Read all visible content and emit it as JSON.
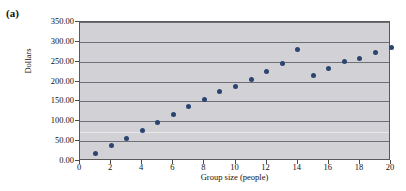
{
  "figure": {
    "panel_label": "(a)"
  },
  "chart_data": {
    "type": "scatter",
    "title": "",
    "xlabel": "Group size (people)",
    "ylabel": "Dollars",
    "xlim": [
      0,
      20
    ],
    "ylim": [
      0,
      350
    ],
    "grid": true,
    "legend": null,
    "marker_color": "#2b4470",
    "plot_background": "#d2d2d6",
    "x_tick_labels": [
      "0",
      "2",
      "4",
      "6",
      "8",
      "10",
      "12",
      "14",
      "16",
      "18",
      "20"
    ],
    "x_ticks": [
      0,
      2,
      4,
      6,
      8,
      10,
      12,
      14,
      16,
      18,
      20
    ],
    "y_tick_labels": [
      "0.00",
      "50.00",
      "100.00",
      "150.00",
      "200.00",
      "250.00",
      "300.00",
      "350.00"
    ],
    "y_ticks": [
      0,
      50,
      100,
      150,
      200,
      250,
      300,
      350
    ],
    "x": [
      1,
      2,
      3,
      4,
      5,
      6,
      7,
      8,
      9,
      10,
      11,
      12,
      13,
      14,
      15,
      16,
      17,
      18,
      19,
      20
    ],
    "values": [
      20,
      40,
      57,
      78,
      98,
      117,
      138,
      155,
      175,
      188,
      205,
      225,
      245,
      280,
      215,
      232,
      250,
      258,
      272,
      285
    ],
    "series": [
      {
        "name": "Dollars",
        "values": [
          20,
          40,
          57,
          78,
          98,
          117,
          138,
          155,
          175,
          188,
          205,
          225,
          245,
          280,
          215,
          232,
          250,
          258,
          272,
          285
        ]
      }
    ]
  }
}
